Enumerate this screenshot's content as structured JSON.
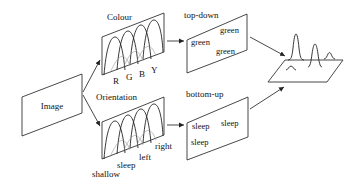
{
  "diagram": {
    "type": "saliency-model",
    "input": {
      "label": "Image"
    },
    "feature_maps": [
      {
        "id": "colour",
        "title": "Colour",
        "channels": [
          "R",
          "G",
          "B",
          "Y"
        ]
      },
      {
        "id": "orientation",
        "title": "Orientation",
        "channels": [
          "shallow",
          "sleep",
          "left",
          "right"
        ]
      }
    ],
    "conspicuity_maps": [
      {
        "id": "top-down",
        "title": "top-down",
        "words": [
          "green",
          "green",
          "green"
        ]
      },
      {
        "id": "bottom-up",
        "title": "bottom-up",
        "words": [
          "sleep",
          "sleep",
          "sleep"
        ]
      }
    ],
    "output": {
      "label": ""
    }
  }
}
